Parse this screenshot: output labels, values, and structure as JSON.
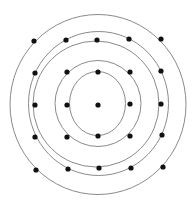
{
  "diagram": {
    "type": "concentric-circles-with-dot-grid",
    "canvas": {
      "width": 196,
      "height": 200,
      "background": "#ffffff"
    },
    "colors": {
      "ring_stroke": "#8a8a8a",
      "dot_fill": "#111111"
    },
    "center": {
      "x": 98,
      "y": 104
    },
    "rings": [
      {
        "id": "ring-1",
        "cx": 98,
        "cy": 104.5,
        "rx": 88,
        "ry": 90
      },
      {
        "id": "ring-2",
        "cx": 98.5,
        "cy": 103.5,
        "rx": 70,
        "ry": 72
      },
      {
        "id": "ring-3",
        "cx": 96,
        "cy": 104,
        "rx": 63,
        "ry": 63
      },
      {
        "id": "ring-4",
        "cx": 98,
        "cy": 103.5,
        "rx": 43,
        "ry": 43
      },
      {
        "id": "ring-5",
        "cx": 97.5,
        "cy": 103.5,
        "rx": 28,
        "ry": 32
      }
    ],
    "dot_radius": 2.6,
    "dots": [
      {
        "x": 34,
        "y": 41
      },
      {
        "x": 66,
        "y": 40
      },
      {
        "x": 97,
        "y": 40
      },
      {
        "x": 129,
        "y": 39
      },
      {
        "x": 161,
        "y": 39
      },
      {
        "x": 35,
        "y": 73
      },
      {
        "x": 67,
        "y": 72
      },
      {
        "x": 98,
        "y": 72
      },
      {
        "x": 130,
        "y": 72
      },
      {
        "x": 161,
        "y": 71
      },
      {
        "x": 35,
        "y": 105
      },
      {
        "x": 67,
        "y": 105
      },
      {
        "x": 98,
        "y": 105
      },
      {
        "x": 130,
        "y": 104
      },
      {
        "x": 161,
        "y": 104
      },
      {
        "x": 35,
        "y": 137
      },
      {
        "x": 67,
        "y": 137
      },
      {
        "x": 98,
        "y": 136
      },
      {
        "x": 130,
        "y": 136
      },
      {
        "x": 162,
        "y": 135
      },
      {
        "x": 36,
        "y": 170
      },
      {
        "x": 68,
        "y": 169
      },
      {
        "x": 99,
        "y": 168
      },
      {
        "x": 131,
        "y": 168
      },
      {
        "x": 163,
        "y": 167
      }
    ]
  }
}
